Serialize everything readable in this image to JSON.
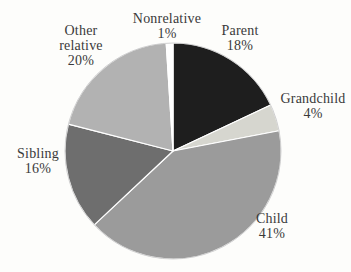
{
  "chart_data": {
    "type": "pie",
    "title": "",
    "unit": "%",
    "start_angle_deg": 0,
    "direction": "clockwise",
    "label_position": "outside",
    "legend": "none",
    "separator_color": "#ffffff",
    "outline_color": "#a8a8a8",
    "background_color": "#fdfdfb",
    "text_color": "#3a3a3a",
    "slices": [
      {
        "label": "Parent",
        "value": 18,
        "pct_text": "18%",
        "color": "#1e1e1e"
      },
      {
        "label": "Grandchild",
        "value": 4,
        "pct_text": "4%",
        "color": "#d6d6cf"
      },
      {
        "label": "Child",
        "value": 41,
        "pct_text": "41%",
        "color": "#9b9b9b"
      },
      {
        "label": "Sibling",
        "value": 16,
        "pct_text": "16%",
        "color": "#6e6e6e"
      },
      {
        "label": "Other relative",
        "value": 20,
        "pct_text": "20%",
        "color": "#b2b2b2"
      },
      {
        "label": "Nonrelative",
        "value": 1,
        "pct_text": "1%",
        "color": "#ffffff"
      }
    ]
  }
}
